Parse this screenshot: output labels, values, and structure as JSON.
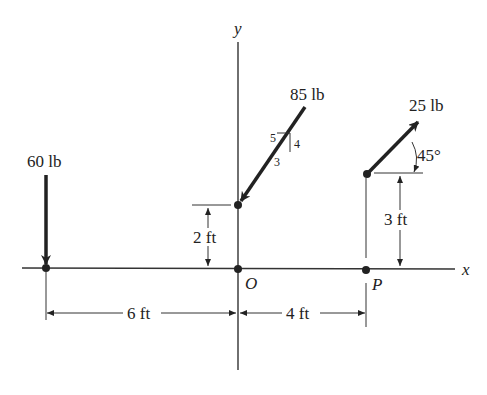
{
  "diagram": {
    "axes": {
      "x_label": "x",
      "y_label": "y",
      "origin_label": "O"
    },
    "point_p_label": "P",
    "forces": [
      {
        "id": "f60",
        "label": "60 lb",
        "direction": "downward"
      },
      {
        "id": "f85",
        "label": "85 lb",
        "slope": {
          "hyp": "5",
          "rise": "4",
          "run": "3"
        }
      },
      {
        "id": "f25",
        "label": "25 lb",
        "angle": "45°"
      }
    ],
    "dimensions": {
      "d6": "6 ft",
      "d4": "4 ft",
      "d2": "2 ft",
      "d3": "3 ft"
    },
    "colors": {
      "ink": "#222222",
      "background": "#ffffff"
    }
  }
}
